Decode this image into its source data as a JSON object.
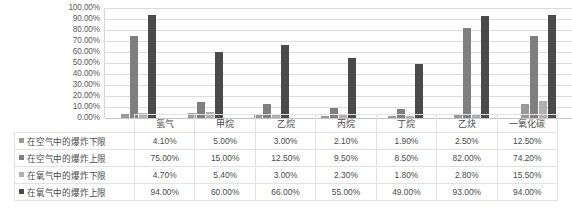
{
  "chart_data": {
    "type": "bar",
    "title": "",
    "xlabel": "",
    "ylabel": "",
    "ylim": [
      0,
      100
    ],
    "grid": true,
    "legend_position": "data-table",
    "unit": "%",
    "y_ticks": [
      "100.00%",
      "90.00%",
      "80.00%",
      "70.00%",
      "60.00%",
      "50.00%",
      "40.00%",
      "30.00%",
      "20.00%",
      "10.00%",
      "0.00%"
    ],
    "categories": [
      "氢气",
      "甲烷",
      "乙烷",
      "丙烷",
      "丁烷",
      "乙炔",
      "一氧化碳"
    ],
    "series": [
      {
        "name": "在空气中的爆炸下限",
        "color": "#9a9a9a",
        "values": [
          4.1,
          5.0,
          3.0,
          2.1,
          1.9,
          2.5,
          12.5
        ],
        "labels": [
          "4.10%",
          "5.00%",
          "3.00%",
          "2.10%",
          "1.90%",
          "2.50%",
          "12.50%"
        ]
      },
      {
        "name": "在空气中的爆炸上限",
        "color": "#7f7f7f",
        "values": [
          75.0,
          15.0,
          12.5,
          9.5,
          8.5,
          82.0,
          74.2
        ],
        "labels": [
          "75.00%",
          "15.00%",
          "12.50%",
          "9.50%",
          "8.50%",
          "82.00%",
          "74.20%"
        ]
      },
      {
        "name": "在氧气中的爆炸下限",
        "color": "#b0b0b0",
        "values": [
          4.7,
          5.4,
          3.0,
          2.3,
          1.8,
          2.8,
          15.5
        ],
        "labels": [
          "4.70%",
          "5.40%",
          "3.00%",
          "2.30%",
          "1.80%",
          "2.80%",
          "15.50%"
        ]
      },
      {
        "name": "在氧气中的爆炸上限",
        "color": "#4a4a4a",
        "values": [
          94.0,
          60.0,
          66.0,
          55.0,
          49.0,
          93.0,
          94.0
        ],
        "labels": [
          "94.00%",
          "60.00%",
          "66.00%",
          "55.00%",
          "49.00%",
          "93.00%",
          "94.00%"
        ]
      }
    ]
  },
  "table": {
    "corner_label": "",
    "column_headers": [
      "氢气",
      "甲烷",
      "乙烷",
      "丙烷",
      "丁烷",
      "乙炔",
      "一氧化碳"
    ],
    "rows": [
      {
        "legend_label": "在空气中的爆炸下限",
        "cells": [
          "4.10%",
          "5.00%",
          "3.00%",
          "2.10%",
          "1.90%",
          "2.50%",
          "12.50%"
        ]
      },
      {
        "legend_label": "在空气中的爆炸上限",
        "cells": [
          "75.00%",
          "15.00%",
          "12.50%",
          "9.50%",
          "8.50%",
          "82.00%",
          "74.20%"
        ]
      },
      {
        "legend_label": "在氧气中的爆炸下限",
        "cells": [
          "4.70%",
          "5.40%",
          "3.00%",
          "2.30%",
          "1.80%",
          "2.80%",
          "15.50%"
        ]
      },
      {
        "legend_label": "在氧气中的爆炸上限",
        "cells": [
          "94.00%",
          "60.00%",
          "66.00%",
          "55.00%",
          "49.00%",
          "93.00%",
          "94.00%"
        ]
      }
    ]
  }
}
